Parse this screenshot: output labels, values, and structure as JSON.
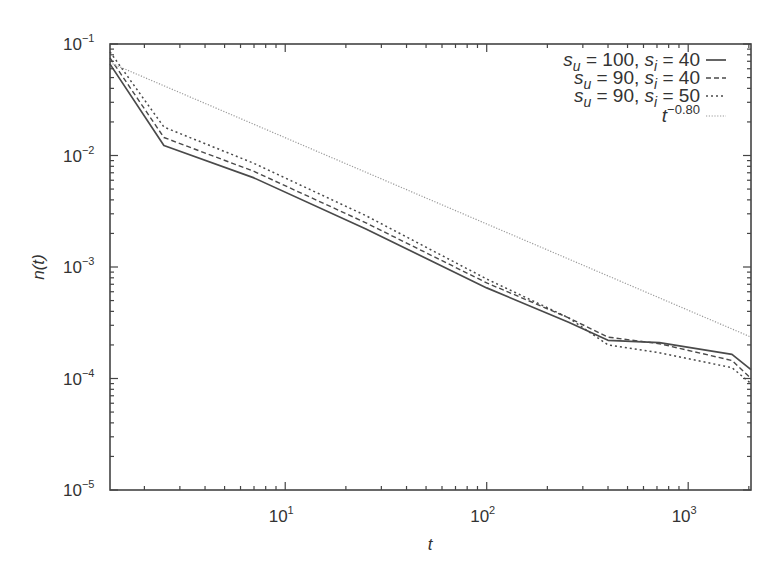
{
  "chart_data": {
    "type": "line",
    "title": "",
    "xlabel": "t",
    "ylabel": "n(t)",
    "xscale": "log",
    "yscale": "log",
    "xlim": [
      1.35,
      2050
    ],
    "ylim": [
      1e-05,
      0.1
    ],
    "grid": false,
    "legend_position": "top-right",
    "x_ticks": [
      {
        "value": 10,
        "base": "10",
        "exp": "1"
      },
      {
        "value": 100,
        "base": "10",
        "exp": "2"
      },
      {
        "value": 1000,
        "base": "10",
        "exp": "3"
      }
    ],
    "y_ticks": [
      {
        "value": 0.1,
        "base": "10",
        "exp": "−1"
      },
      {
        "value": 0.01,
        "base": "10",
        "exp": "−2"
      },
      {
        "value": 0.001,
        "base": "10",
        "exp": "−3"
      },
      {
        "value": 0.0001,
        "base": "10",
        "exp": "−4"
      },
      {
        "value": 1e-05,
        "base": "10",
        "exp": "−5"
      }
    ],
    "series": [
      {
        "name": "s_u = 100, s_i = 40",
        "label_parts": {
          "a": "s",
          "a_sub": "u",
          "a_val": " = 100, ",
          "b": "s",
          "b_sub": "i",
          "b_val": " = 40"
        },
        "style": "solid",
        "color": "#4a4a4a",
        "x": [
          1.35,
          2.5,
          7,
          25,
          100,
          255,
          400,
          720,
          1650,
          2050
        ],
        "y": [
          0.066,
          0.0123,
          0.0063,
          0.0022,
          0.00065,
          0.00032,
          0.00022,
          0.00021,
          0.000165,
          0.00012
        ]
      },
      {
        "name": "s_u = 90, s_i = 40",
        "label_parts": {
          "a": "s",
          "a_sub": "u",
          "a_val": " = 90, ",
          "b": "s",
          "b_sub": "i",
          "b_val": " = 40"
        },
        "style": "dashed",
        "color": "#4a4a4a",
        "x": [
          1.35,
          2.5,
          7,
          25,
          100,
          255,
          400,
          720,
          1650,
          2050
        ],
        "y": [
          0.075,
          0.0145,
          0.0072,
          0.0025,
          0.00072,
          0.00035,
          0.000235,
          0.000205,
          0.000145,
          0.0001
        ]
      },
      {
        "name": "s_u = 90, s_i = 50",
        "label_parts": {
          "a": "s",
          "a_sub": "u",
          "a_val": " = 90, ",
          "b": "s",
          "b_sub": "i",
          "b_val": " = 50"
        },
        "style": "dotted",
        "color": "#4a4a4a",
        "x": [
          1.35,
          2.5,
          7,
          25,
          100,
          255,
          400,
          720,
          1650,
          2050
        ],
        "y": [
          0.085,
          0.018,
          0.0085,
          0.0029,
          0.00078,
          0.00035,
          0.0002,
          0.00017,
          0.000125,
          9e-05
        ]
      },
      {
        "name": "t^-0.80",
        "label_parts": {
          "a": "t",
          "a_sup": "−0.80"
        },
        "style": "fine-dotted",
        "color": "#9a9a9a",
        "x": [
          1.35,
          2050
        ],
        "y": [
          0.068,
          0.000235
        ]
      }
    ]
  }
}
